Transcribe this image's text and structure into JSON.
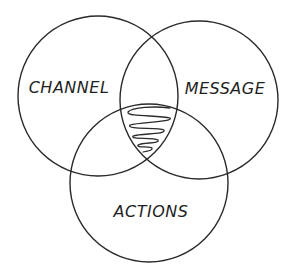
{
  "diagram": {
    "type": "venn",
    "background": "#ffffff",
    "stroke_color": "#2a2a2a",
    "text_color": "#1f1f1f",
    "sets": [
      {
        "id": "channel",
        "label": "CHANNEL",
        "cx": 98,
        "cy": 96,
        "r": 80,
        "label_x": 69,
        "label_y": 93
      },
      {
        "id": "message",
        "label": "MESSAGE",
        "cx": 199,
        "cy": 100,
        "r": 79,
        "label_x": 225,
        "label_y": 94
      },
      {
        "id": "actions",
        "label": "ACTIONS",
        "cx": 149,
        "cy": 183,
        "r": 79,
        "label_x": 151,
        "label_y": 217
      }
    ],
    "center_intersection": {
      "description": "triple overlap highlighted with a hand-drawn zig-zag scribble",
      "icon": "scribble-fill"
    }
  }
}
